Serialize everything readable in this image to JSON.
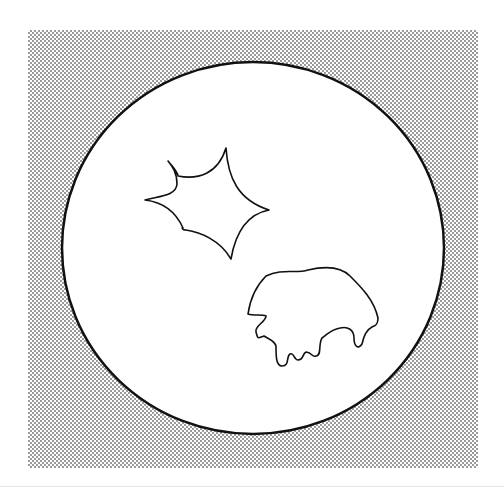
{
  "figure": {
    "background_color": "#ffffff",
    "stipple": {
      "x": 28,
      "y": 30,
      "width": 450,
      "height": 438,
      "dot_color": "#6b6b6b",
      "spacing": 4
    },
    "circle": {
      "cx": 253,
      "cy": 248,
      "rx": 191,
      "ry": 186,
      "stroke": "#111111",
      "stroke_width": 2.5,
      "fill": "#ffffff"
    },
    "shapes": [
      {
        "name": "star-shaped-spot",
        "stroke": "#111111"
      },
      {
        "name": "irregular-lobed-spot",
        "stroke": "#111111"
      }
    ]
  }
}
